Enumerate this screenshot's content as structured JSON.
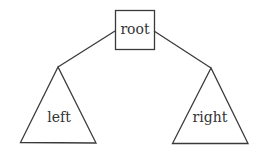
{
  "diagram": {
    "type": "binary-tree-schematic",
    "nodes": {
      "root": {
        "label": "root",
        "shape": "square"
      },
      "left": {
        "label": "left",
        "shape": "triangle"
      },
      "right": {
        "label": "right",
        "shape": "triangle"
      }
    },
    "edges": [
      {
        "from": "root",
        "to": "left"
      },
      {
        "from": "root",
        "to": "right"
      }
    ],
    "colors": {
      "stroke": "#3a3a3a",
      "text": "#333333",
      "background": "#ffffff"
    }
  }
}
